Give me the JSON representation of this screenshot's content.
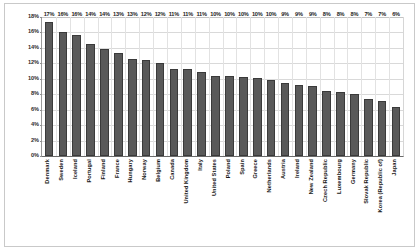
{
  "chart_data": {
    "type": "bar",
    "title": "",
    "subtitle": "",
    "xlabel": "",
    "ylabel": "",
    "ylim": [
      0,
      18
    ],
    "ytick_labels": [
      "18%",
      "16%",
      "14%",
      "12%",
      "10%",
      "8%",
      "6%",
      "4%",
      "2%",
      "0%"
    ],
    "ytick_values": [
      18,
      16,
      14,
      12,
      10,
      8,
      6,
      4,
      2,
      0
    ],
    "grid": true,
    "legend": "none",
    "categories": [
      "Denmark",
      "Sweden",
      "Iceland",
      "Portugal",
      "Finland",
      "France",
      "Hungary",
      "Norway",
      "Belgium",
      "Canada",
      "United Kingdom",
      "Italy",
      "United States",
      "Poland",
      "Spain",
      "Greece",
      "Netherlands",
      "Austria",
      "Ireland",
      "New Zealand",
      "Czech Republic",
      "Luxembourg",
      "Germany",
      "Slovak Republic",
      "Korea (Republic of)",
      "Japan"
    ],
    "values": [
      17.4,
      16.1,
      15.7,
      14.5,
      13.8,
      13.4,
      12.5,
      12.4,
      12.1,
      11.3,
      11.3,
      10.9,
      10.4,
      10.3,
      10.2,
      10.1,
      9.8,
      9.4,
      9.2,
      9.1,
      8.4,
      8.3,
      8.0,
      7.4,
      7.1,
      6.4
    ],
    "data_labels": [
      "17%",
      "16%",
      "16%",
      "14%",
      "14%",
      "13%",
      "13%",
      "12%",
      "12%",
      "11%",
      "11%",
      "11%",
      "10%",
      "10%",
      "10%",
      "10%",
      "10%",
      "9%",
      "9%",
      "9%",
      "8%",
      "8%",
      "8%",
      "7%",
      "7%",
      "6%"
    ],
    "bar_color": "#595959",
    "bar_border_color": "#3a3a3a",
    "grid_color": "#d9d9d9",
    "axis_color": "#6b6b6b",
    "plot_background": "#ffffff",
    "frame_border_color": "#c9c9c9"
  }
}
